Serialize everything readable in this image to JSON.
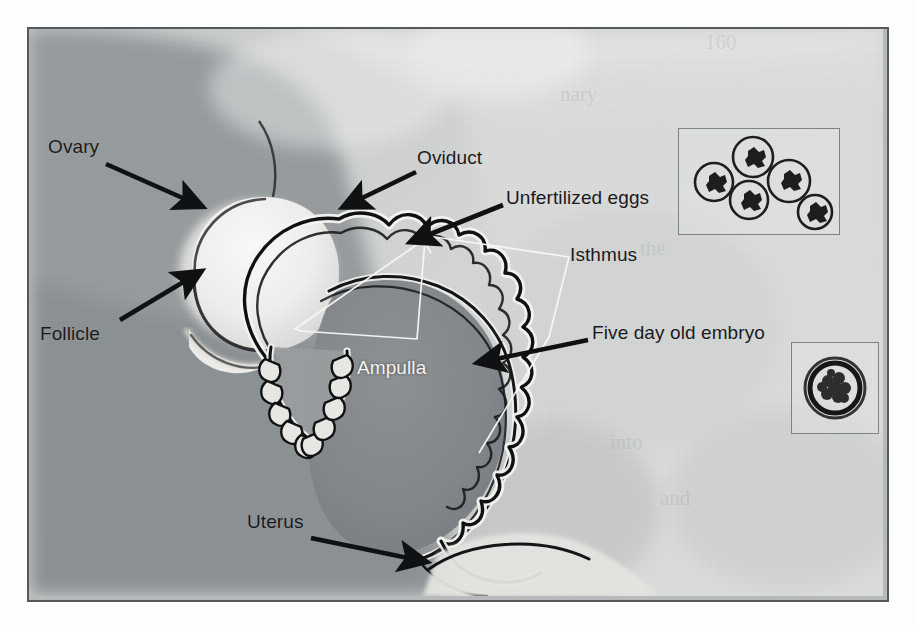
{
  "figure": {
    "kind": "scanned photographic line diagram",
    "frame": {
      "border_color": "#555a5e",
      "background_color": "#b9bcbd"
    },
    "labels": [
      {
        "id": "ovary",
        "text": "Ovary",
        "color": "#18191b",
        "x": 48,
        "y": 137
      },
      {
        "id": "oviduct",
        "text": "Oviduct",
        "color": "#18191b",
        "x": 417,
        "y": 148
      },
      {
        "id": "unfert",
        "text": "Unfertilized eggs",
        "color": "#18191b",
        "x": 506,
        "y": 188
      },
      {
        "id": "isthmus",
        "text": "Isthmus",
        "color": "#18191b",
        "x": 570,
        "y": 245
      },
      {
        "id": "follicle",
        "text": "Follicle",
        "color": "#18191b",
        "x": 40,
        "y": 324
      },
      {
        "id": "embryo",
        "text": "Five day old embryo",
        "color": "#18191b",
        "x": 592,
        "y": 323
      },
      {
        "id": "ampulla",
        "text": "Ampulla",
        "color": "#f2f3f3",
        "x": 357,
        "y": 358
      },
      {
        "id": "uterus",
        "text": "Uterus",
        "color": "#18191b",
        "x": 247,
        "y": 512
      }
    ],
    "arrows": [
      {
        "id": "arrow-ovary",
        "points_to": "ovary",
        "from": [
          104,
          162
        ],
        "to": [
          190,
          198
        ]
      },
      {
        "id": "arrow-follicle",
        "points_to": "follicle",
        "from": [
          118,
          318
        ],
        "to": [
          188,
          278
        ]
      },
      {
        "id": "arrow-oviduct",
        "points_to": "oviduct",
        "from": [
          414,
          170
        ],
        "to": [
          355,
          197
        ]
      },
      {
        "id": "arrow-unfert",
        "points_to": "unfert",
        "from": [
          501,
          203
        ],
        "to": [
          424,
          232
        ]
      },
      {
        "id": "arrow-embryo",
        "points_to": "embryo",
        "from": [
          586,
          338
        ],
        "to": [
          491,
          357
        ]
      },
      {
        "id": "arrow-uterus",
        "points_to": "uterus",
        "from": [
          309,
          536
        ],
        "to": [
          408,
          556
        ]
      }
    ],
    "leaders": [
      {
        "id": "leader-ampulla",
        "label": "ampulla",
        "color": "#ffffff",
        "path": "M 294,330 L 424,240 L 416,340 L 300,332 L 294,330"
      },
      {
        "id": "leader-isthmus",
        "label": "isthmus",
        "color": "#ffffff",
        "path": "M 420,236 L 566,258 M 566,258 L 547,336 L 478,452 M 420,236 L 430,253"
      }
    ],
    "insets": [
      {
        "id": "inset-unfertilized-eggs",
        "caption_ref": "unfert",
        "x": 676,
        "y": 126,
        "w": 162,
        "h": 107,
        "content": "five round unfertilized eggs with dark granular centres",
        "item_count": 5,
        "items": [
          {
            "cx": 56,
            "cy": 52,
            "r": 20
          },
          {
            "cx": 105,
            "cy": 28,
            "r": 21
          },
          {
            "cx": 98,
            "cy": 72,
            "r": 20
          },
          {
            "cx": 124,
            "cy": 52,
            "r": 22
          },
          {
            "cx": 144,
            "cy": 86,
            "r": 19
          }
        ]
      },
      {
        "id": "inset-five-day-embryo",
        "caption_ref": "embryo",
        "x": 789,
        "y": 340,
        "w": 88,
        "h": 92,
        "content": "one spherical blastocyst embryo inside a thick zona pellucida",
        "item_count": 1,
        "items": [
          {
            "cx": 44,
            "cy": 46,
            "r": 31
          }
        ]
      }
    ],
    "anatomy_parts": [
      "ovary",
      "follicle",
      "fimbriae",
      "oviduct (infundibulum)",
      "ampulla",
      "isthmus",
      "uterine horn",
      "uterus"
    ]
  },
  "bleed_through": [
    {
      "text": "160",
      "x": 705,
      "y": 30
    },
    {
      "text": "nary",
      "x": 560,
      "y": 82
    },
    {
      "text": "the",
      "x": 640,
      "y": 236
    },
    {
      "text": "into",
      "x": 610,
      "y": 430
    },
    {
      "text": "and",
      "x": 660,
      "y": 486
    }
  ]
}
